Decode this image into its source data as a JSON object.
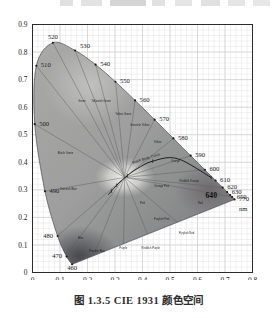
{
  "caption": {
    "text": "图 1.3.5    CIE 1931 颜色空间"
  },
  "chart_data": {
    "type": "scatter",
    "title": "CIE 1931 颜色空间",
    "xlabel": "x",
    "ylabel": "y",
    "xlim": [
      0,
      0.8
    ],
    "ylim": [
      0,
      0.9
    ],
    "grid": true,
    "grid_major_step": 0.1,
    "grid_minor_step": 0.02,
    "legend_position": "none",
    "xticks": [
      "0",
      "0.1",
      "0.2",
      "0.3",
      "0.4",
      "0.5",
      "0.6",
      "0.7",
      "0.8"
    ],
    "yticks": [
      "0",
      "0.1",
      "0.2",
      "0.3",
      "0.4",
      "0.5",
      "0.6",
      "0.7",
      "0.8",
      "0.9"
    ],
    "annotations": {
      "black_body_curve_label": "Black Body Curve",
      "unit_label": "nm"
    },
    "spectral_locus": {
      "name": "Spectral locus (monochromatic wavelengths)",
      "unit": "nm",
      "points": [
        {
          "nm": 460,
          "x": 0.144,
          "y": 0.0297
        },
        {
          "nm": 470,
          "x": 0.1241,
          "y": 0.0578
        },
        {
          "nm": 480,
          "x": 0.0913,
          "y": 0.1327
        },
        {
          "nm": 490,
          "x": 0.0454,
          "y": 0.295
        },
        {
          "nm": 500,
          "x": 0.0082,
          "y": 0.5384
        },
        {
          "nm": 510,
          "x": 0.0139,
          "y": 0.7502
        },
        {
          "nm": 520,
          "x": 0.0743,
          "y": 0.8338
        },
        {
          "nm": 530,
          "x": 0.1547,
          "y": 0.8059
        },
        {
          "nm": 540,
          "x": 0.2296,
          "y": 0.7543
        },
        {
          "nm": 550,
          "x": 0.3016,
          "y": 0.6923
        },
        {
          "nm": 560,
          "x": 0.3731,
          "y": 0.6245
        },
        {
          "nm": 570,
          "x": 0.4441,
          "y": 0.5547
        },
        {
          "nm": 580,
          "x": 0.5125,
          "y": 0.4866
        },
        {
          "nm": 590,
          "x": 0.5752,
          "y": 0.4242
        },
        {
          "nm": 600,
          "x": 0.627,
          "y": 0.3725
        },
        {
          "nm": 610,
          "x": 0.6658,
          "y": 0.334
        },
        {
          "nm": 620,
          "x": 0.6915,
          "y": 0.3083
        },
        {
          "nm": 630,
          "x": 0.7079,
          "y": 0.292
        },
        {
          "nm": 640,
          "x": 0.719,
          "y": 0.2809
        },
        {
          "nm": 650,
          "x": 0.726,
          "y": 0.274
        },
        {
          "nm": 770,
          "x": 0.7347,
          "y": 0.2653
        }
      ]
    },
    "wavelength_labels": [
      {
        "text": "460",
        "x": 0.144,
        "y": 0.0297,
        "pos": "below"
      },
      {
        "text": "470",
        "x": 0.1241,
        "y": 0.0578,
        "pos": "left"
      },
      {
        "text": "480",
        "x": 0.0913,
        "y": 0.1327,
        "pos": "left"
      },
      {
        "text": "490",
        "x": 0.0454,
        "y": 0.295,
        "pos": "right"
      },
      {
        "text": "500",
        "x": 0.0082,
        "y": 0.5384,
        "pos": "right"
      },
      {
        "text": "510",
        "x": 0.0139,
        "y": 0.7502,
        "pos": "right"
      },
      {
        "text": "520",
        "x": 0.0743,
        "y": 0.8338,
        "pos": "above"
      },
      {
        "text": "530",
        "x": 0.1547,
        "y": 0.8059,
        "pos": "above-right"
      },
      {
        "text": "540",
        "x": 0.2296,
        "y": 0.7543,
        "pos": "right"
      },
      {
        "text": "550",
        "x": 0.3016,
        "y": 0.6923,
        "pos": "right"
      },
      {
        "text": "560",
        "x": 0.3731,
        "y": 0.6245,
        "pos": "right"
      },
      {
        "text": "570",
        "x": 0.4441,
        "y": 0.5547,
        "pos": "right"
      },
      {
        "text": "580",
        "x": 0.5125,
        "y": 0.4866,
        "pos": "right"
      },
      {
        "text": "590",
        "x": 0.5752,
        "y": 0.4242,
        "pos": "right"
      },
      {
        "text": "600",
        "x": 0.627,
        "y": 0.3725,
        "pos": "right"
      },
      {
        "text": "610",
        "x": 0.6658,
        "y": 0.334,
        "pos": "right"
      },
      {
        "text": "620",
        "x": 0.6915,
        "y": 0.3083,
        "pos": "right"
      },
      {
        "text": "630",
        "x": 0.7079,
        "y": 0.292,
        "pos": "right"
      },
      {
        "text": "650",
        "x": 0.726,
        "y": 0.274,
        "pos": "right"
      },
      {
        "text": "770",
        "x": 0.7347,
        "y": 0.2653,
        "pos": "right"
      },
      {
        "text": "nm",
        "x": 0.7347,
        "y": 0.23,
        "pos": "right"
      },
      {
        "text": "640",
        "x": 0.65,
        "y": 0.275,
        "pos": "inside-bold"
      }
    ],
    "black_body_curve": {
      "name": "Planckian locus",
      "points": [
        {
          "x": 0.6499,
          "y": 0.3446
        },
        {
          "x": 0.5267,
          "y": 0.4133
        },
        {
          "x": 0.4369,
          "y": 0.4041
        },
        {
          "x": 0.3805,
          "y": 0.3768
        },
        {
          "x": 0.3451,
          "y": 0.3516
        },
        {
          "x": 0.3221,
          "y": 0.3318
        },
        {
          "x": 0.3064,
          "y": 0.3166
        },
        {
          "x": 0.2952,
          "y": 0.3048
        },
        {
          "x": 0.2869,
          "y": 0.2956
        },
        {
          "x": 0.2807,
          "y": 0.2884
        },
        {
          "x": 0.2757,
          "y": 0.2826
        }
      ]
    },
    "region_labels": [
      {
        "text": "Bluish Green",
        "x": 0.12,
        "y": 0.43
      },
      {
        "text": "Greenish Blue",
        "x": 0.13,
        "y": 0.3
      },
      {
        "text": "Blue",
        "x": 0.175,
        "y": 0.12
      },
      {
        "text": "Purplish Blue",
        "x": 0.235,
        "y": 0.075
      },
      {
        "text": "Purple",
        "x": 0.33,
        "y": 0.085
      },
      {
        "text": "Reddish Purple",
        "x": 0.43,
        "y": 0.085
      },
      {
        "text": "Purplish Pink",
        "x": 0.47,
        "y": 0.19
      },
      {
        "text": "Pink",
        "x": 0.4,
        "y": 0.25
      },
      {
        "text": "Purplish Red",
        "x": 0.56,
        "y": 0.14
      },
      {
        "text": "Red",
        "x": 0.61,
        "y": 0.25
      },
      {
        "text": "Reddish Orange",
        "x": 0.57,
        "y": 0.33
      },
      {
        "text": "Orange",
        "x": 0.52,
        "y": 0.4
      },
      {
        "text": "Orange Pink",
        "x": 0.47,
        "y": 0.31
      },
      {
        "text": "Yellow",
        "x": 0.455,
        "y": 0.47
      },
      {
        "text": "Greenish Yellow",
        "x": 0.39,
        "y": 0.53
      },
      {
        "text": "Yellow Green",
        "x": 0.33,
        "y": 0.57
      },
      {
        "text": "Yellowish Green",
        "x": 0.25,
        "y": 0.62
      },
      {
        "text": "Green",
        "x": 0.18,
        "y": 0.62
      }
    ]
  }
}
